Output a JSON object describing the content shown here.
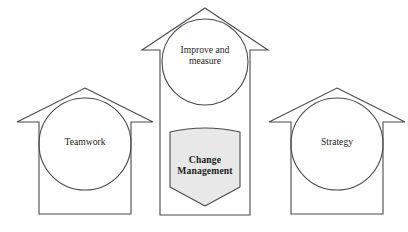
{
  "diagram": {
    "type": "arrow-house-diagram",
    "background_color": "#ffffff",
    "outline_color": "#4a4a4a",
    "highlight_fill_color": "#e8e8e8",
    "text_color": "#1c1c1c",
    "nodes": [
      {
        "id": "teamwork",
        "label": "Teamwork",
        "shape": "up-arrow",
        "inner_shape": "circle",
        "emphasis": "plain"
      },
      {
        "id": "improve-and-measure",
        "label": "Improve and\nmeasure",
        "shape": "up-arrow-tall",
        "inner_shape": "circle",
        "emphasis": "plain"
      },
      {
        "id": "change-management",
        "label": "Change\nManagement",
        "shape": "shield-pentagon",
        "inner_shape": "none",
        "emphasis": "bold"
      },
      {
        "id": "strategy",
        "label": "Strategy",
        "shape": "up-arrow",
        "inner_shape": "circle",
        "emphasis": "plain"
      }
    ]
  }
}
